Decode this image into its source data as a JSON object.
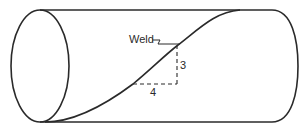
{
  "diagram": {
    "labels": {
      "weld": "Weld",
      "rise": "3",
      "run": "4"
    },
    "slope": {
      "rise": 3,
      "run": 4
    },
    "colors": {
      "line": "#2a2a2a",
      "background": "#ffffff"
    }
  }
}
